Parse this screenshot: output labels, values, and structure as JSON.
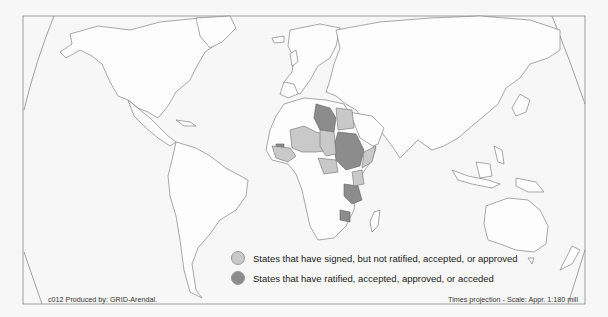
{
  "map": {
    "title": "World map of treaty status",
    "projection_label": "Times projection - Scale: Appr. 1:180 mill",
    "credit": "c012 Produced by: GRID-Arendal.",
    "colors": {
      "background": "#f7f7f7",
      "land": "#fdfdfd",
      "border": "#6e6e6e",
      "signed": "#c9c9c9",
      "ratified": "#8c8c8c"
    },
    "highlighted_regions": {
      "ratified": [
        "Libya",
        "Sudan",
        "Tanzania",
        "Zimbabwe",
        "Gambia/Guinea-Bissau area",
        "Central African region"
      ],
      "signed": [
        "Egypt",
        "Mali",
        "Niger",
        "Chad",
        "Burkina Faso",
        "Guinea",
        "Senegal",
        "Ghana",
        "Benin",
        "Cameroon",
        "Central African Republic",
        "Somalia",
        "Kenya"
      ]
    }
  },
  "legend": {
    "items": [
      {
        "label": "States that have signed, but not ratified, accepted, or approved",
        "color": "#c9c9c9"
      },
      {
        "label": "States that have ratified, accepted, approved, or acceded",
        "color": "#8c8c8c"
      }
    ]
  }
}
